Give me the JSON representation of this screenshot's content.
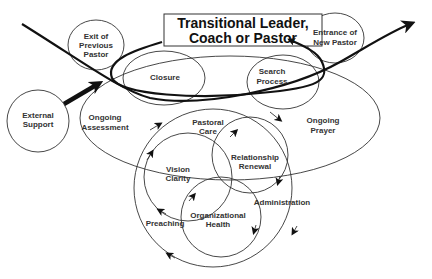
{
  "diagram": {
    "title_box": {
      "line1": "Transitional Leader,",
      "line2": "Coach or Pastor"
    },
    "nodes": {
      "exit_previous_pastor": {
        "line1": "Exit of",
        "line2": "Previous",
        "line3": "Pastor"
      },
      "entrance_new_pastor": {
        "line1": "Entrance of",
        "line2": "New Pastor"
      },
      "external_support": {
        "line1": "External",
        "line2": "Support"
      },
      "closure": {
        "line1": "Closure"
      },
      "search_process": {
        "line1": "Search",
        "line2": "Process"
      },
      "ongoing_assessment": {
        "line1": "Ongoing",
        "line2": "Assessment"
      },
      "ongoing_prayer": {
        "line1": "Ongoing",
        "line2": "Prayer"
      },
      "pastoral_care": {
        "line1": "Pastoral",
        "line2": "Care"
      },
      "relationship_renewal": {
        "line1": "Relationship",
        "line2": "Renewal"
      },
      "vision_clarity": {
        "line1": "Vision",
        "line2": "Clarity"
      },
      "organizational_health": {
        "line1": "Organizational",
        "line2": "Health"
      },
      "administration": {
        "line1": "Administration"
      },
      "preaching": {
        "line1": "Preaching"
      }
    },
    "colors": {
      "stroke": "#333333",
      "text": "#333333",
      "background": "#ffffff"
    }
  }
}
